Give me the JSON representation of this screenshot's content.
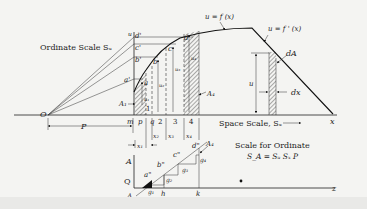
{
  "figure": {
    "type": "graphical-integration-diagram",
    "labels": {
      "curve_primary": "u = f (x)",
      "curve_derivative": "u = f ' (x)",
      "ordinate_scale": "Ordinate Scale Sᵤ",
      "space_scale": "Space Scale, Sₓ",
      "scale_for_ordinate_title": "Scale for Ordinate",
      "scale_formula": "S_A = Sᵤ Sₓ P",
      "origin": "O",
      "pole_distance": "P",
      "x_axis": "x",
      "z_axis": "z",
      "u_axis": "u",
      "area_A1": "A₁",
      "area_A4": "A₄",
      "area_dA": "dA",
      "dx": "dx",
      "u_height": "u",
      "Q": "Q",
      "A_axis": "A",
      "A_bottom": "A",
      "k": "k",
      "h": "h"
    },
    "ordinate_points": [
      "a'",
      "b'",
      "c'",
      "d'"
    ],
    "curve_points": [
      "a",
      "b",
      "c",
      "d"
    ],
    "strip_ticks": [
      "m",
      "p",
      "q",
      "2",
      "3",
      "4"
    ],
    "strip_numbers": [
      "1",
      "2",
      "3",
      "4"
    ],
    "strip_widths": [
      "x₁",
      "x₂",
      "x₃",
      "x₄"
    ],
    "heights": [
      "u₁",
      "u₂",
      "u₃",
      "u₄"
    ],
    "integral_points": [
      "a\"",
      "b\"",
      "c\"",
      "d\""
    ],
    "increments": [
      "g₁",
      "g₂",
      "g₃",
      "g₄"
    ]
  }
}
